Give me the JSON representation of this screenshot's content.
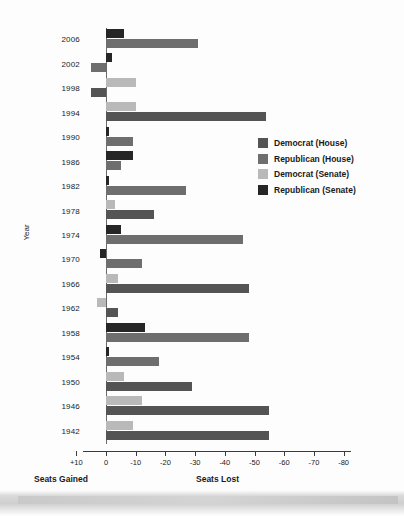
{
  "chart_data": {
    "type": "bar",
    "orientation": "horizontal",
    "title": "",
    "xlabel": "",
    "ylabel": "Year",
    "xlim": [
      10,
      -80
    ],
    "grid": false,
    "legend_position": "right-middle",
    "axis_captions": {
      "left": "Seats Gained",
      "right": "Seats Lost"
    },
    "xticks": [
      "+10",
      "0",
      "-10",
      "-20",
      "-30",
      "-40",
      "-50",
      "-60",
      "-70",
      "-80"
    ],
    "xtick_values": [
      10,
      0,
      -10,
      -20,
      -30,
      -40,
      -50,
      -60,
      -70,
      -80
    ],
    "categories": [
      "2006",
      "2002",
      "1998",
      "1994",
      "1990",
      "1986",
      "1982",
      "1978",
      "1974",
      "1970",
      "1966",
      "1962",
      "1958",
      "1954",
      "1950",
      "1946",
      "1942"
    ],
    "series": [
      {
        "name": "Democrat (House)",
        "key": "dem_house",
        "color": "#545454"
      },
      {
        "name": "Republican (House)",
        "key": "rep_house",
        "color": "#6e6e6e"
      },
      {
        "name": "Democrat (Senate)",
        "key": "dem_senate",
        "color": "#b9b9b9"
      },
      {
        "name": "Republican (Senate)",
        "key": "rep_senate",
        "color": "#262626"
      }
    ],
    "rows": [
      {
        "year": "2006",
        "top": {
          "series": "rep_senate",
          "value": -6
        },
        "bottom": {
          "series": "rep_house",
          "value": -31
        }
      },
      {
        "year": "2002",
        "top": {
          "series": "rep_senate",
          "value": -2
        },
        "bottom": {
          "series": "rep_house",
          "value": 5
        }
      },
      {
        "year": "1998",
        "top": {
          "series": "dem_senate",
          "value": -10
        },
        "bottom": {
          "series": "dem_house",
          "value": 5
        }
      },
      {
        "year": "1994",
        "top": {
          "series": "dem_senate",
          "value": -10
        },
        "bottom": {
          "series": "dem_house",
          "value": -54
        }
      },
      {
        "year": "1990",
        "top": {
          "series": "rep_senate",
          "value": -1
        },
        "bottom": {
          "series": "rep_house",
          "value": -9
        }
      },
      {
        "year": "1986",
        "top": {
          "series": "rep_senate",
          "value": -9
        },
        "bottom": {
          "series": "rep_house",
          "value": -5
        }
      },
      {
        "year": "1982",
        "top": {
          "series": "rep_senate",
          "value": -1
        },
        "bottom": {
          "series": "rep_house",
          "value": -27
        }
      },
      {
        "year": "1978",
        "top": {
          "series": "dem_senate",
          "value": -3
        },
        "bottom": {
          "series": "dem_house",
          "value": -16
        }
      },
      {
        "year": "1974",
        "top": {
          "series": "rep_senate",
          "value": -5
        },
        "bottom": {
          "series": "rep_house",
          "value": -46
        }
      },
      {
        "year": "1970",
        "top": {
          "series": "rep_senate",
          "value": 2
        },
        "bottom": {
          "series": "rep_house",
          "value": -12
        }
      },
      {
        "year": "1966",
        "top": {
          "series": "dem_senate",
          "value": -4
        },
        "bottom": {
          "series": "dem_house",
          "value": -48
        }
      },
      {
        "year": "1962",
        "top": {
          "series": "dem_senate",
          "value": 3
        },
        "bottom": {
          "series": "dem_house",
          "value": -4
        }
      },
      {
        "year": "1958",
        "top": {
          "series": "rep_senate",
          "value": -13
        },
        "bottom": {
          "series": "rep_house",
          "value": -48
        }
      },
      {
        "year": "1954",
        "top": {
          "series": "rep_senate",
          "value": -1
        },
        "bottom": {
          "series": "rep_house",
          "value": -18
        }
      },
      {
        "year": "1950",
        "top": {
          "series": "dem_senate",
          "value": -6
        },
        "bottom": {
          "series": "dem_house",
          "value": -29
        }
      },
      {
        "year": "1946",
        "top": {
          "series": "dem_senate",
          "value": -12
        },
        "bottom": {
          "series": "dem_house",
          "value": -55
        }
      },
      {
        "year": "1942",
        "top": {
          "series": "dem_senate",
          "value": -9
        },
        "bottom": {
          "series": "dem_house",
          "value": -55
        }
      }
    ]
  },
  "legend": {
    "items": [
      {
        "label": "Democrat (House)",
        "color": "#545454"
      },
      {
        "label": "Republican (House)",
        "color": "#6e6e6e"
      },
      {
        "label": "Democrat (Senate)",
        "color": "#b9b9b9"
      },
      {
        "label": "Republican (Senate)",
        "color": "#262626"
      }
    ]
  },
  "axis": {
    "y_title": "Year",
    "caption_gained": "Seats Gained",
    "caption_lost": "Seats Lost"
  }
}
